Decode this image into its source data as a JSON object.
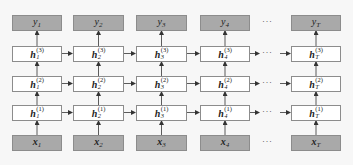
{
  "diagram": {
    "columns": [
      {
        "id": "1",
        "y": "y",
        "y_sub": "1",
        "x": "x",
        "x_sub": "1",
        "h_sub": "1"
      },
      {
        "id": "2",
        "y": "y",
        "y_sub": "2",
        "x": "x",
        "x_sub": "2",
        "h_sub": "2"
      },
      {
        "id": "3",
        "y": "y",
        "y_sub": "3",
        "x": "x",
        "x_sub": "3",
        "h_sub": "3"
      },
      {
        "id": "4",
        "y": "y",
        "y_sub": "4",
        "x": "x",
        "x_sub": "4",
        "h_sub": "4"
      },
      {
        "id": "T",
        "y": "y",
        "y_sub": "T",
        "x": "x",
        "x_sub": "T",
        "h_sub": "T"
      }
    ],
    "layers": [
      {
        "name": "h",
        "sup": "(3)"
      },
      {
        "name": "h",
        "sup": "(2)"
      },
      {
        "name": "h",
        "sup": "(1)"
      }
    ],
    "ellipsis": "···",
    "colors": {
      "input_output_fill": "#a9a9a9",
      "hidden_fill": "#ffffff",
      "border": "#8c8c8c",
      "arrow": "#333333"
    }
  }
}
